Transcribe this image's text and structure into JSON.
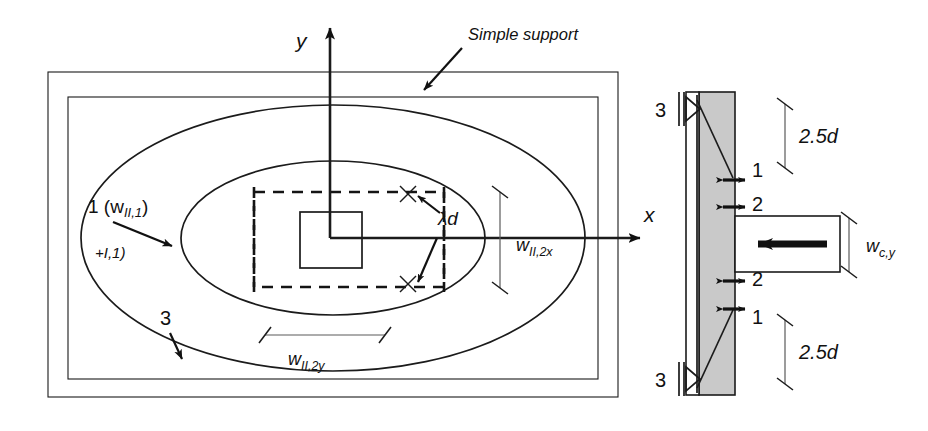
{
  "figure": {
    "plan_view": {
      "axis_y_label": "y",
      "axis_x_label": "x",
      "simple_support_label": "Simple support",
      "yield_line_1_label": "1 (w_II,1)",
      "yield_line_1_label_plain": "1 (w",
      "yield_line_1_sub": "II,1",
      "yield_line_1_tail": ")",
      "artifact_label": "+I,1)",
      "yield_line_3_label": "3",
      "lambda_d_label": "λd",
      "dim_w_II_2x": "w_II,2x",
      "dim_w_II_2x_main": "w",
      "dim_w_II_2x_sub": "II,2x",
      "dim_w_II_2y": "w_II,2y",
      "dim_w_II_2y_main": "w",
      "dim_w_II_2y_sub": "II,2y"
    },
    "section_view": {
      "support_top_label": "3",
      "support_bottom_label": "2",
      "support_bottom_label_2": "3",
      "crack_1_top": "1",
      "crack_2_top": "2",
      "crack_2_bottom": "2",
      "crack_1_bottom": "1",
      "dim_top": "2.5d",
      "dim_bottom": "2.5d",
      "column_width_label": "w_c,y",
      "column_width_main": "w",
      "column_width_sub": "c,y"
    },
    "colors": {
      "line": "#1b1b1b",
      "slab_fill": "#c9c9c9",
      "dim_line": "#5a5a5a",
      "background": "#ffffff"
    }
  }
}
